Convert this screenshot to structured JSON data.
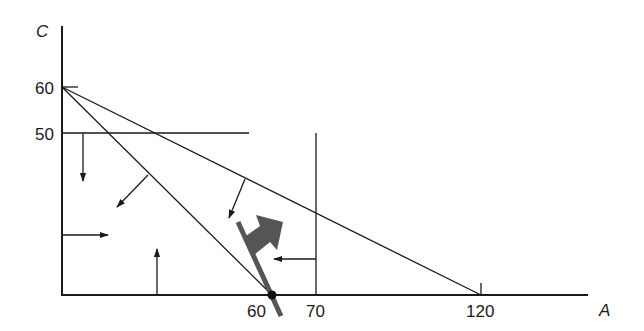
{
  "diagram": {
    "axes": {
      "x_label": "A",
      "y_label": "C"
    },
    "y_ticks": [
      {
        "label": "60",
        "value": 60
      },
      {
        "label": "50",
        "value": 50
      }
    ],
    "x_ticks": [
      {
        "label": "60",
        "value": 60
      },
      {
        "label": "70",
        "value": 70
      },
      {
        "label": "120",
        "value": 120
      }
    ],
    "constraints": [
      {
        "name": "C <= 50",
        "type": "horizontal line at C=50"
      },
      {
        "name": "A <= 70",
        "type": "vertical line at A=70"
      },
      {
        "name": "A + C <= 60",
        "from": [
          0,
          60
        ],
        "to": [
          60,
          0
        ]
      },
      {
        "name": "A + 2C <= 120",
        "from": [
          0,
          60
        ],
        "to": [
          120,
          0
        ]
      },
      {
        "name": "A >= 0"
      },
      {
        "name": "C >= 0"
      }
    ],
    "optimum_point": {
      "A": 60,
      "C": 0
    },
    "colors": {
      "line": "#1a1a1a",
      "objective_arrow": "#555555"
    }
  }
}
